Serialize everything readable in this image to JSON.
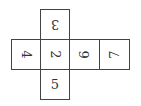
{
  "diagram": {
    "type": "cube-net",
    "line_color": "#444444",
    "text_color": "#333333",
    "faces": [
      {
        "id": "top",
        "label": "3",
        "row": 0,
        "col": 1,
        "rotation_deg": 180
      },
      {
        "id": "left",
        "label": "4",
        "row": 1,
        "col": 0,
        "rotation_deg": 90
      },
      {
        "id": "center",
        "label": "2",
        "row": 1,
        "col": 1,
        "rotation_deg": 90
      },
      {
        "id": "right1",
        "label": "6",
        "row": 1,
        "col": 2,
        "rotation_deg": -90
      },
      {
        "id": "right2",
        "label": "7",
        "row": 1,
        "col": 3,
        "rotation_deg": -90
      },
      {
        "id": "bottom",
        "label": "5",
        "row": 2,
        "col": 1,
        "rotation_deg": 0
      }
    ]
  }
}
